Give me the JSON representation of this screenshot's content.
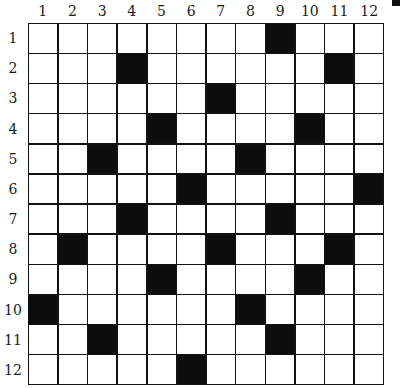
{
  "puzzle": {
    "rows": 12,
    "cols": 12,
    "col_labels": [
      "1",
      "2",
      "3",
      "4",
      "5",
      "6",
      "7",
      "8",
      "9",
      "10",
      "11",
      "12"
    ],
    "row_labels": [
      "1",
      "2",
      "3",
      "4",
      "5",
      "6",
      "7",
      "8",
      "9",
      "10",
      "11",
      "12"
    ],
    "colors": {
      "black": "#0d0d0d",
      "white": "#ffffff",
      "line": "#111111"
    },
    "black_cells": [
      [
        1,
        9
      ],
      [
        2,
        4
      ],
      [
        2,
        11
      ],
      [
        3,
        7
      ],
      [
        4,
        5
      ],
      [
        4,
        10
      ],
      [
        5,
        3
      ],
      [
        5,
        8
      ],
      [
        6,
        6
      ],
      [
        6,
        12
      ],
      [
        7,
        4
      ],
      [
        7,
        9
      ],
      [
        8,
        2
      ],
      [
        8,
        7
      ],
      [
        8,
        11
      ],
      [
        9,
        5
      ],
      [
        9,
        10
      ],
      [
        10,
        1
      ],
      [
        10,
        8
      ],
      [
        11,
        3
      ],
      [
        11,
        9
      ],
      [
        12,
        6
      ]
    ]
  }
}
